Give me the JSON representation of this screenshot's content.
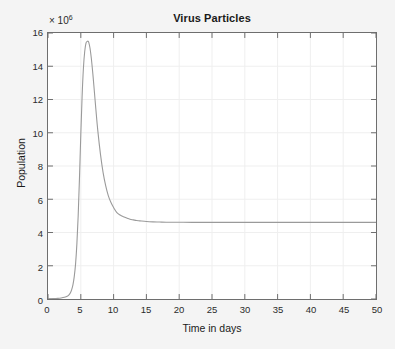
{
  "chart_data": {
    "type": "line",
    "title": "Virus Particles",
    "xlabel": "Time in days",
    "ylabel": "Population",
    "y_exponent_prefix": "× 10",
    "y_exponent_power": "6",
    "y_scale_factor": 1000000,
    "xlim": [
      0,
      50
    ],
    "ylim": [
      0,
      16
    ],
    "xticks": [
      0,
      5,
      10,
      15,
      20,
      25,
      30,
      35,
      40,
      45,
      50
    ],
    "yticks": [
      0,
      2,
      4,
      6,
      8,
      10,
      12,
      14,
      16
    ],
    "xtick_labels": [
      "0",
      "5",
      "10",
      "15",
      "20",
      "25",
      "30",
      "35",
      "40",
      "45",
      "50"
    ],
    "ytick_labels": [
      "0",
      "2",
      "4",
      "6",
      "8",
      "10",
      "12",
      "14",
      "16"
    ],
    "grid": true,
    "legend": null,
    "line_color": "#9a9a9a",
    "axis_color": "#6e6e6e",
    "grid_color": "#efefef",
    "plot_background": "#ffffff",
    "figure_background": "#f4f4f4",
    "series": [
      {
        "name": "Virus Particles",
        "x": [
          0,
          0.5,
          1,
          1.5,
          2,
          2.5,
          3,
          3.2,
          3.4,
          3.6,
          3.8,
          4,
          4.2,
          4.4,
          4.6,
          4.8,
          5,
          5.2,
          5.4,
          5.6,
          5.8,
          6,
          6.1,
          6.2,
          6.4,
          6.6,
          6.8,
          7,
          7.3,
          7.6,
          8,
          8.4,
          8.8,
          9.2,
          9.6,
          10,
          10.5,
          11,
          11.5,
          12,
          12.5,
          13,
          13.5,
          14,
          15,
          16,
          17,
          18,
          20,
          22,
          25,
          30,
          35,
          40,
          45,
          50
        ],
        "y": [
          0.02,
          0.02,
          0.03,
          0.04,
          0.06,
          0.1,
          0.18,
          0.25,
          0.36,
          0.55,
          0.85,
          1.35,
          2.1,
          3.3,
          5.0,
          7.3,
          9.9,
          12.2,
          13.9,
          14.9,
          15.4,
          15.5,
          15.5,
          15.45,
          15.1,
          14.5,
          13.7,
          12.8,
          11.4,
          10.1,
          8.7,
          7.6,
          6.8,
          6.2,
          5.8,
          5.5,
          5.2,
          5.05,
          4.95,
          4.87,
          4.8,
          4.76,
          4.72,
          4.7,
          4.66,
          4.64,
          4.63,
          4.62,
          4.62,
          4.61,
          4.61,
          4.61,
          4.61,
          4.61,
          4.61,
          4.61
        ]
      }
    ]
  }
}
